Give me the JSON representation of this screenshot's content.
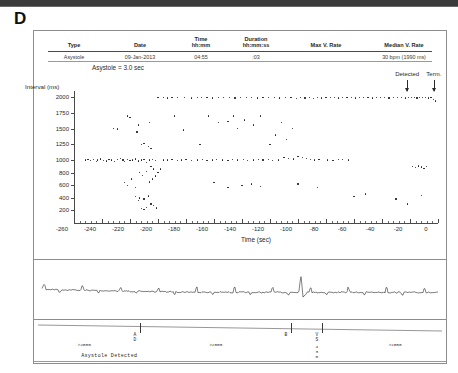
{
  "panel": {
    "letter": "D"
  },
  "episode_table": {
    "columns": [
      {
        "id": "type",
        "label": "Type",
        "sub": ""
      },
      {
        "id": "date",
        "label": "Date",
        "sub": ""
      },
      {
        "id": "time",
        "label": "Time",
        "sub": "hh:mm"
      },
      {
        "id": "duration",
        "label": "Duration",
        "sub": "hh:mm:ss"
      },
      {
        "id": "max_v_rate",
        "label": "Max V. Rate",
        "sub": ""
      },
      {
        "id": "med_v_rate",
        "label": "Median V. Rate",
        "sub": ""
      }
    ],
    "rows": [
      {
        "type": "Asystole",
        "date": "09-Jan-2013",
        "time": "04:55",
        "duration": ":03",
        "max_v_rate": "",
        "med_v_rate": "30 bpm (1990 ms)"
      }
    ],
    "note": "Asystole = 3.0 sec"
  },
  "annotations": [
    {
      "id": "detected",
      "label": "Detected",
      "x_sec": -22
    },
    {
      "id": "terminated",
      "label": "Term.",
      "x_sec": -3
    }
  ],
  "chart_data": {
    "type": "scatter",
    "title": "",
    "xlabel": "Time (sec)",
    "ylabel": "Interval (ms)",
    "xlim": [
      -260,
      0
    ],
    "ylim": [
      0,
      2100
    ],
    "xticks": [
      -260,
      -240,
      -220,
      -200,
      -180,
      -160,
      -140,
      -120,
      -100,
      -80,
      -60,
      -40,
      -20,
      0
    ],
    "yticks": [
      200,
      400,
      600,
      800,
      1000,
      1250,
      1500,
      1750,
      2000
    ],
    "xtick_labels": [
      "-260",
      "-240",
      "-220",
      "-200",
      "-180",
      "-160",
      "-140",
      "-120",
      "-100",
      "-80",
      "-60",
      "-40",
      "-20",
      "0"
    ],
    "ytick_labels": [
      "200",
      "400",
      "600",
      "800",
      "1000",
      "1250",
      "1500",
      "1750",
      "2000"
    ],
    "grid": false,
    "legend": false,
    "series": [
      {
        "name": "Ventricular interval",
        "points": [
          [
            -252,
            1000
          ],
          [
            -250,
            1005
          ],
          [
            -248,
            990
          ],
          [
            -246,
            1010
          ],
          [
            -244,
            980
          ],
          [
            -243,
            1000
          ],
          [
            -241,
            1020
          ],
          [
            -239,
            995
          ],
          [
            -237,
            985
          ],
          [
            -235,
            1015
          ],
          [
            -233,
            1000
          ],
          [
            -231,
            975
          ],
          [
            -229,
            1005
          ],
          [
            -227,
            1030
          ],
          [
            -225,
            1000
          ],
          [
            -224,
            980
          ],
          [
            -222,
            1010
          ],
          [
            -220,
            995
          ],
          [
            -218,
            1000
          ],
          [
            -216,
            1020
          ],
          [
            -214,
            985
          ],
          [
            -212,
            1000
          ],
          [
            -210,
            1005
          ],
          [
            -208,
            960
          ],
          [
            -206,
            1000
          ],
          [
            -204,
            1015
          ],
          [
            -202,
            990
          ],
          [
            -232,
            1500
          ],
          [
            -229,
            1495
          ],
          [
            -222,
            1700
          ],
          [
            -220,
            1680
          ],
          [
            -215,
            1450
          ],
          [
            -212,
            1250
          ],
          [
            -210,
            1260
          ],
          [
            -207,
            1220
          ],
          [
            -205,
            1180
          ],
          [
            -214,
            1560
          ],
          [
            -206,
            1600
          ],
          [
            -224,
            640
          ],
          [
            -222,
            600
          ],
          [
            -219,
            700
          ],
          [
            -216,
            560
          ],
          [
            -213,
            800
          ],
          [
            -211,
            760
          ],
          [
            -208,
            820
          ],
          [
            -205,
            900
          ],
          [
            -203,
            860
          ],
          [
            -216,
            420
          ],
          [
            -213,
            400
          ],
          [
            -210,
            380
          ],
          [
            -207,
            430
          ],
          [
            -214,
            360
          ],
          [
            -212,
            230
          ],
          [
            -210,
            210
          ],
          [
            -208,
            250
          ],
          [
            -205,
            300
          ],
          [
            -203,
            280
          ],
          [
            -201,
            240
          ],
          [
            -206,
            650
          ],
          [
            -204,
            700
          ],
          [
            -202,
            750
          ],
          [
            -200,
            800
          ],
          [
            -198,
            860
          ],
          [
            -196,
            1000
          ],
          [
            -193,
            1000
          ],
          [
            -190,
            1005
          ],
          [
            -186,
            990
          ],
          [
            -183,
            1000
          ],
          [
            -180,
            1010
          ],
          [
            -176,
            995
          ],
          [
            -172,
            1000
          ],
          [
            -168,
            1005
          ],
          [
            -165,
            990
          ],
          [
            -161,
            1000
          ],
          [
            -158,
            1010
          ],
          [
            -154,
            1000
          ],
          [
            -150,
            995
          ],
          [
            -147,
            1005
          ],
          [
            -143,
            1000
          ],
          [
            -139,
            1010
          ],
          [
            -136,
            990
          ],
          [
            -132,
            1000
          ],
          [
            -128,
            1005
          ],
          [
            -125,
            1000
          ],
          [
            -121,
            1010
          ],
          [
            -118,
            995
          ],
          [
            -114,
            1000
          ],
          [
            -110,
            1040
          ],
          [
            -107,
            1030
          ],
          [
            -103,
            1020
          ],
          [
            -100,
            1060
          ],
          [
            -97,
            1045
          ],
          [
            -94,
            1030
          ],
          [
            -91,
            1015
          ],
          [
            -88,
            1000
          ],
          [
            -85,
            1010
          ],
          [
            -79,
            1000
          ],
          [
            -75,
            995
          ],
          [
            -71,
            1005
          ],
          [
            -68,
            1010
          ],
          [
            -64,
            1000
          ],
          [
            -18,
            900
          ],
          [
            -16,
            880
          ],
          [
            -14,
            905
          ],
          [
            -12,
            890
          ],
          [
            -10,
            870
          ],
          [
            -8,
            900
          ],
          [
            -200,
            2000
          ],
          [
            -196,
            2000
          ],
          [
            -193,
            1990
          ],
          [
            -190,
            2000
          ],
          [
            -186,
            1995
          ],
          [
            -181,
            2000
          ],
          [
            -176,
            1990
          ],
          [
            -172,
            2000
          ],
          [
            -169,
            1995
          ],
          [
            -165,
            2000
          ],
          [
            -161,
            1990
          ],
          [
            -157,
            2000
          ],
          [
            -153,
            1995
          ],
          [
            -149,
            2000
          ],
          [
            -145,
            1990
          ],
          [
            -141,
            2000
          ],
          [
            -137,
            1995
          ],
          [
            -133,
            2000
          ],
          [
            -129,
            1990
          ],
          [
            -125,
            2000
          ],
          [
            -121,
            1995
          ],
          [
            -117,
            2000
          ],
          [
            -113,
            1990
          ],
          [
            -109,
            2000
          ],
          [
            -105,
            1995
          ],
          [
            -101,
            1985
          ],
          [
            -98,
            2000
          ],
          [
            -95,
            1990
          ],
          [
            -92,
            2000
          ],
          [
            -89,
            1985
          ],
          [
            -86,
            2000
          ],
          [
            -83,
            1990
          ],
          [
            -80,
            2000
          ],
          [
            -77,
            1995
          ],
          [
            -74,
            2000
          ],
          [
            -71,
            1990
          ],
          [
            -68,
            2000
          ],
          [
            -65,
            1995
          ],
          [
            -62,
            2000
          ],
          [
            -59,
            1990
          ],
          [
            -56,
            2000
          ],
          [
            -53,
            1995
          ],
          [
            -50,
            2000
          ],
          [
            -47,
            1990
          ],
          [
            -44,
            2000
          ],
          [
            -41,
            1995
          ],
          [
            -38,
            2000
          ],
          [
            -35,
            1990
          ],
          [
            -32,
            2000
          ],
          [
            -29,
            1995
          ],
          [
            -26,
            2000
          ],
          [
            -23,
            1990
          ],
          [
            -21,
            2000
          ],
          [
            -19,
            1995
          ],
          [
            -17,
            2000
          ],
          [
            -15,
            1990
          ],
          [
            -13,
            2000
          ],
          [
            -11,
            1995
          ],
          [
            -9,
            2000
          ],
          [
            -7,
            1990
          ],
          [
            -5,
            2000
          ],
          [
            -3,
            1960
          ],
          [
            -2,
            1940
          ],
          [
            -188,
            1700
          ],
          [
            -182,
            1480
          ],
          [
            -170,
            1250
          ],
          [
            -164,
            1700
          ],
          [
            -157,
            1600
          ],
          [
            -150,
            1620
          ],
          [
            -146,
            1700
          ],
          [
            -143,
            1500
          ],
          [
            -138,
            1640
          ],
          [
            -132,
            1560
          ],
          [
            -127,
            1700
          ],
          [
            -120,
            1250
          ],
          [
            -116,
            1400
          ],
          [
            -112,
            1600
          ],
          [
            -108,
            1330
          ],
          [
            -104,
            1500
          ],
          [
            -160,
            640
          ],
          [
            -150,
            560
          ],
          [
            -140,
            600
          ],
          [
            -133,
            620
          ],
          [
            -127,
            580
          ],
          [
            -100,
            620
          ],
          [
            -86,
            560
          ],
          [
            -60,
            420
          ],
          [
            -52,
            460
          ],
          [
            -30,
            380
          ],
          [
            -22,
            300
          ],
          [
            -12,
            440
          ]
        ]
      }
    ]
  },
  "egm": {
    "label": "",
    "baseline_noise": true,
    "spike_x_sec": -98
  },
  "markers": {
    "events": [
      {
        "id": "ad",
        "label_lines": [
          "A",
          "D"
        ],
        "x_sec": -213
      },
      {
        "id": "b",
        "label_lines": [
          "B"
        ],
        "x_sec": -105
      },
      {
        "id": "vs",
        "label_lines": [
          "V",
          "S"
        ],
        "x_sec": -83
      }
    ],
    "numbers": [
      {
        "id": "vs-interval",
        "digits": [
          "4",
          "3",
          "0"
        ],
        "x_sec": -83
      }
    ],
    "intervals": [
      {
        "id": "int-left",
        "text": ">2000",
        "x_sec": -242
      },
      {
        "id": "int-mid",
        "text": ">2000",
        "x_sec": -148
      },
      {
        "id": "int-right",
        "text": ">2000",
        "x_sec": -20
      }
    ],
    "caption": {
      "text": "Asystole Detected",
      "x_sec": -192
    }
  }
}
